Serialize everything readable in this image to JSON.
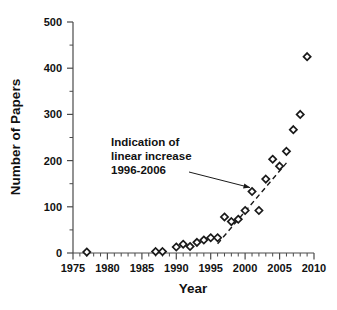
{
  "chart_data": {
    "type": "scatter",
    "title": "",
    "xlabel": "Year",
    "ylabel": "Number of Papers",
    "xlim": [
      1975,
      2010
    ],
    "ylim": [
      0,
      500
    ],
    "xticks": [
      1975,
      1980,
      1985,
      1990,
      1995,
      2000,
      2005,
      2010
    ],
    "xticklabels": [
      "1975",
      "1980",
      "1985",
      "1990",
      "1995",
      "2000",
      "2005",
      "2010"
    ],
    "yticks": [
      0,
      100,
      200,
      300,
      400,
      500
    ],
    "yticklabels": [
      "0",
      "100",
      "200",
      "300",
      "400",
      "500"
    ],
    "x_minor_tick_interval": 1,
    "y_minor_tick_interval": 50,
    "grid": false,
    "legend": false,
    "marker": "open-diamond",
    "series": [
      {
        "name": "Number of Papers",
        "x": [
          1977,
          1987,
          1988,
          1990,
          1991,
          1992,
          1993,
          1994,
          1995,
          1996,
          1997,
          1998,
          1999,
          2000,
          2001,
          2002,
          2003,
          2004,
          2005,
          2006,
          2007,
          2008
        ],
        "y": [
          2,
          3,
          3,
          13,
          19,
          14,
          23,
          28,
          33,
          33,
          78,
          68,
          73,
          92,
          133,
          92,
          160,
          203,
          188,
          220,
          267,
          300
        ],
        "values_note": "Number of papers per publication year"
      },
      {
        "name": "Final point",
        "x": [
          2009
        ],
        "y": [
          425
        ]
      }
    ],
    "fit_line": {
      "label": "Indication of linear increase 1996-2006",
      "style": "dashed",
      "x_start": 1996,
      "y_start": 20,
      "x_end": 2006,
      "y_end": 195
    },
    "annotations": [
      {
        "name": "linear-increase-callout",
        "lines": [
          "Indication of",
          "linear increase",
          "1996-2006"
        ],
        "points_to_x": 2001,
        "points_to_y": 133
      }
    ]
  },
  "axes": {
    "x_title": "Year",
    "y_title": "Number of Papers"
  },
  "annotation": {
    "line1": "Indication of",
    "line2": "linear increase",
    "line3": "1996-2006"
  },
  "colors": {
    "background": "#ffffff",
    "axis": "#4a4a4a",
    "text": "#111111",
    "marker_stroke": "#1a1a1a",
    "marker_fill": "#ffffff"
  }
}
